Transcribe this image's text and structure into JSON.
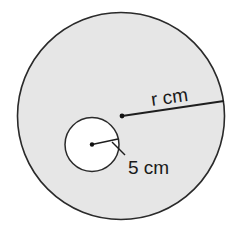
{
  "diagram": {
    "type": "concentric-style circle diagram",
    "outer_circle": {
      "fill": "#e6e6e6",
      "stroke": "#2a2a2a",
      "radius_label": "r cm"
    },
    "inner_circle": {
      "fill": "#ffffff",
      "stroke": "#2a2a2a",
      "radius_label": "5 cm"
    },
    "colors": {
      "line": "#1e1e1e",
      "background": "#ffffff"
    }
  }
}
